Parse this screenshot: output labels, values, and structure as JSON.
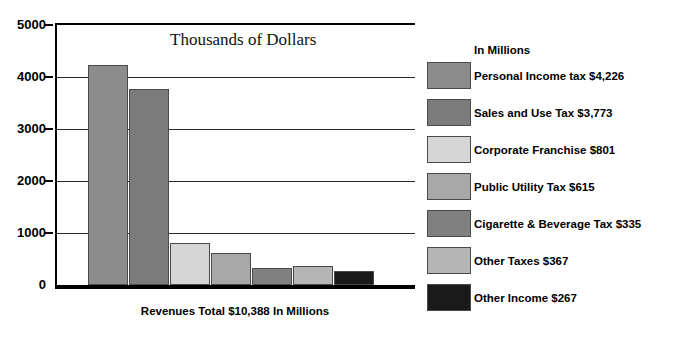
{
  "chart_data": {
    "type": "bar",
    "title": "Thousands of Dollars",
    "xlabel": "Revenues Total $10,388 In Millions",
    "ylabel": "",
    "ylim": [
      0,
      5000
    ],
    "grid": true,
    "legend_position": "right",
    "legend_title": "In Millions",
    "ytick_labels": [
      "5000",
      "4000",
      "3000",
      "2000",
      "1000",
      "0"
    ],
    "ytick_values": [
      5000,
      4000,
      3000,
      2000,
      1000,
      0
    ],
    "categories": [
      "Personal Income tax",
      "Sales and Use Tax",
      "Corporate Franchise",
      "Public Utility Tax",
      "Cigarette & Beverage Tax",
      "Other Taxes",
      "Other Income"
    ],
    "values": [
      4226,
      3773,
      801,
      615,
      335,
      367,
      267
    ],
    "total": 10388,
    "units": "Millions of Dollars",
    "series": [
      {
        "name": "Revenues",
        "values": [
          4226,
          3773,
          801,
          615,
          335,
          367,
          267
        ]
      }
    ],
    "bars": [
      {
        "category": "Personal Income tax",
        "value": 4226,
        "value_text": "$4,226",
        "color": "#8c8c8c"
      },
      {
        "category": "Sales and Use Tax",
        "value": 3773,
        "value_text": "$3,773",
        "color": "#7b7b7b"
      },
      {
        "category": "Corporate Franchise",
        "value": 801,
        "value_text": "$801",
        "color": "#d5d5d5"
      },
      {
        "category": "Public Utility Tax",
        "value": 615,
        "value_text": "$615",
        "color": "#a8a8a8"
      },
      {
        "category": "Cigarette & Beverage Tax",
        "value": 335,
        "value_text": "$335",
        "color": "#808080"
      },
      {
        "category": "Other Taxes",
        "value": 367,
        "value_text": "$367",
        "color": "#b5b5b5"
      },
      {
        "category": "Other Income",
        "value": 267,
        "value_text": "$267",
        "color": "#1a1a1a"
      }
    ],
    "legend_entries": [
      {
        "label": "Personal Income tax $4,226",
        "color": "#8c8c8c"
      },
      {
        "label": "Sales and Use Tax $3,773",
        "color": "#7b7b7b"
      },
      {
        "label": "Corporate Franchise $801",
        "color": "#d5d5d5"
      },
      {
        "label": "Public Utility Tax $615",
        "color": "#a8a8a8"
      },
      {
        "label": "Cigarette & Beverage Tax $335",
        "color": "#808080"
      },
      {
        "label": "Other Taxes $367",
        "color": "#b5b5b5"
      },
      {
        "label": "Other Income $267",
        "color": "#1a1a1a"
      }
    ]
  }
}
